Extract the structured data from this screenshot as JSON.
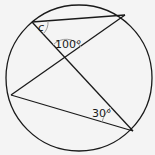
{
  "diagram": {
    "type": "circle-geometry",
    "circle": {
      "cx": 79,
      "cy": 78,
      "r": 73
    },
    "points": {
      "A": {
        "x": 32,
        "y": 22
      },
      "B": {
        "x": 125,
        "y": 15
      },
      "C": {
        "x": 11,
        "y": 95
      },
      "D": {
        "x": 133,
        "y": 131
      }
    },
    "segments": [
      [
        "A",
        "B"
      ],
      [
        "A",
        "D"
      ],
      [
        "B",
        "C"
      ],
      [
        "C",
        "D"
      ]
    ],
    "labels": {
      "angle_c": "c",
      "angle_100": "100°",
      "angle_30": "30°"
    },
    "colors": {
      "line": "#1a1a1a",
      "arc": "#888888",
      "background": "#f4f4f4"
    }
  }
}
